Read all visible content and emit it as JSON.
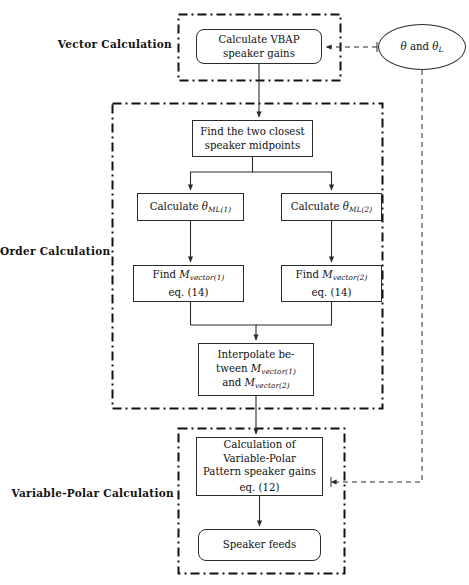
{
  "diagram": {
    "groups": [
      {
        "id": "vector",
        "label": "Vector Calculation"
      },
      {
        "id": "order",
        "label": "Order Calculation"
      },
      {
        "id": "varpolar",
        "label": "Variable-Polar Calculation"
      }
    ],
    "nodes": {
      "vbap": {
        "name": "calculate-vbap-speaker-gains",
        "shape": "rounded-rect",
        "line1": "Calculate VBAP",
        "line2": "speaker gains"
      },
      "midpoints": {
        "name": "find-two-closest-speaker-midpoints",
        "shape": "rect",
        "line1": "Find the two closest",
        "line2": "speaker midpoints"
      },
      "theta1": {
        "name": "calculate-theta-ml1",
        "shape": "rect",
        "prefix": "Calculate ",
        "symbol": "θ",
        "subscript": "ML(1)"
      },
      "theta2": {
        "name": "calculate-theta-ml2",
        "shape": "rect",
        "prefix": "Calculate ",
        "symbol": "θ",
        "subscript": "ML(2)"
      },
      "mvec1": {
        "name": "find-m-vector1",
        "shape": "rect",
        "prefix": "Find ",
        "symbol": "M",
        "subscript": "vector(1)",
        "eq": "eq. (14)"
      },
      "mvec2": {
        "name": "find-m-vector2",
        "shape": "rect",
        "prefix": "Find ",
        "symbol": "M",
        "subscript": "vector(2)",
        "eq": "eq. (14)"
      },
      "interpolate": {
        "name": "interpolate-between-m-vectors",
        "shape": "rect",
        "line1": "Interpolate be-",
        "line2_prefix": "tween ",
        "line2_symbol": "M",
        "line2_sub": "vector(1)",
        "line3_prefix": "and ",
        "line3_symbol": "M",
        "line3_sub": "vector(2)"
      },
      "varpolar": {
        "name": "calculation-of-variable-polar-pattern-speaker-gains",
        "shape": "rect",
        "line1": "Calculation of",
        "line2": "Variable-Polar",
        "line3": "Pattern speaker gains",
        "eq": "eq. (12)"
      },
      "feeds": {
        "name": "speaker-feeds",
        "shape": "rounded-rect",
        "line1": "Speaker feeds"
      },
      "theta_input": {
        "name": "theta-and-theta-l-input",
        "shape": "ellipse",
        "prefix": "",
        "symbol1": "θ",
        "conjunction": " and ",
        "symbol2": "θ",
        "subscript2": "L"
      }
    },
    "edges": [
      {
        "from": "theta_input",
        "to": "vbap",
        "style": "dashed"
      },
      {
        "from": "theta_input",
        "to": "varpolar",
        "style": "dashed"
      },
      {
        "from": "vbap",
        "to": "midpoints",
        "style": "solid"
      },
      {
        "from": "midpoints",
        "to": "theta1",
        "style": "solid"
      },
      {
        "from": "midpoints",
        "to": "theta2",
        "style": "solid"
      },
      {
        "from": "theta1",
        "to": "mvec1",
        "style": "solid"
      },
      {
        "from": "theta2",
        "to": "mvec2",
        "style": "solid"
      },
      {
        "from": "mvec1",
        "to": "interpolate",
        "style": "solid"
      },
      {
        "from": "mvec2",
        "to": "interpolate",
        "style": "solid"
      },
      {
        "from": "interpolate",
        "to": "varpolar",
        "style": "solid"
      },
      {
        "from": "varpolar",
        "to": "feeds",
        "style": "solid"
      }
    ],
    "colors": {
      "stroke": "#2b2b2b",
      "group_border": "#111111",
      "background": "#ffffff",
      "text": "#111111"
    }
  }
}
